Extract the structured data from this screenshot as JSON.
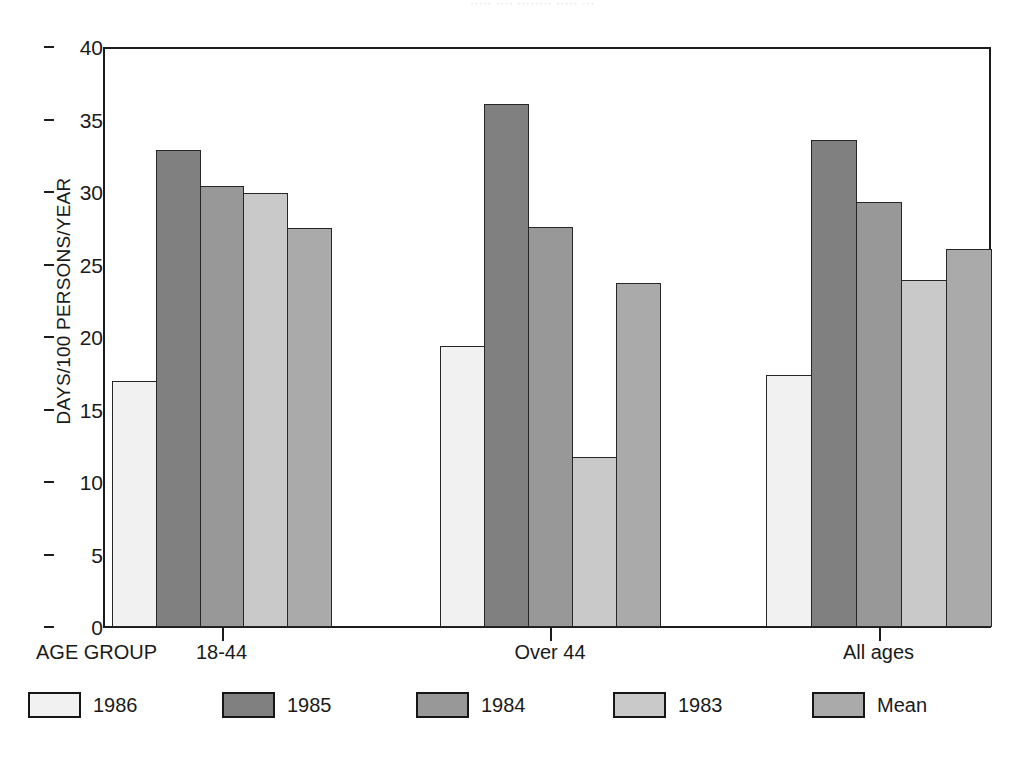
{
  "top_cut_text": "·····  ····  ········  ·····  ···",
  "axis": {
    "x_caption": "AGE GROUP",
    "y_title": "DAYS/100 PERSONS/YEAR",
    "y_ticks": [
      "0",
      "5",
      "10",
      "15",
      "20",
      "25",
      "30",
      "35",
      "40"
    ]
  },
  "chart_data": {
    "type": "bar",
    "title": "",
    "xlabel": "AGE GROUP",
    "ylabel": "DAYS/100 PERSONS/YEAR",
    "ylim": [
      0,
      40
    ],
    "ytick_step": 5,
    "grid": false,
    "legend_position": "bottom",
    "categories": [
      "18-44",
      "Over 44",
      "All ages"
    ],
    "series": [
      {
        "name": "1986",
        "color": "#f1f1f1",
        "values": [
          17.0,
          19.4,
          17.4
        ]
      },
      {
        "name": "1985",
        "color": "#808080",
        "values": [
          32.9,
          36.1,
          33.6
        ]
      },
      {
        "name": "1984",
        "color": "#989898",
        "values": [
          30.4,
          27.6,
          29.3
        ]
      },
      {
        "name": "1983",
        "color": "#c9c9c9",
        "values": [
          29.9,
          11.7,
          23.9
        ]
      },
      {
        "name": "Mean",
        "color": "#aaaaaa",
        "values": [
          27.5,
          23.7,
          26.1
        ]
      }
    ]
  }
}
